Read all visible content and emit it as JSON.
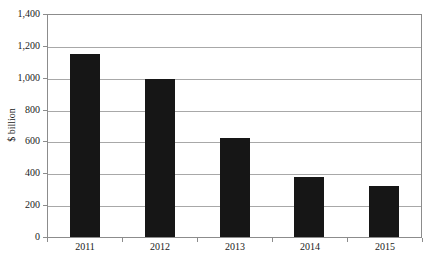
{
  "chart_data": {
    "type": "bar",
    "title": "",
    "categories": [
      "2011",
      "2012",
      "2013",
      "2014",
      "2015"
    ],
    "values": [
      1150,
      990,
      620,
      375,
      320
    ],
    "xlabel": "",
    "ylabel": "$ billion",
    "ylim": [
      0,
      1400
    ],
    "ytick_interval": 200,
    "ytick_labels": [
      "0",
      "200",
      "400",
      "600",
      "800",
      "1,000",
      "1,200",
      "1,400"
    ],
    "grid": true,
    "legend": "none",
    "colors": {
      "bar": "#161616",
      "gridline": "#a8a8a8",
      "axis": "#8c8c8c",
      "text": "#1a1a1a",
      "background": "#ffffff"
    }
  }
}
